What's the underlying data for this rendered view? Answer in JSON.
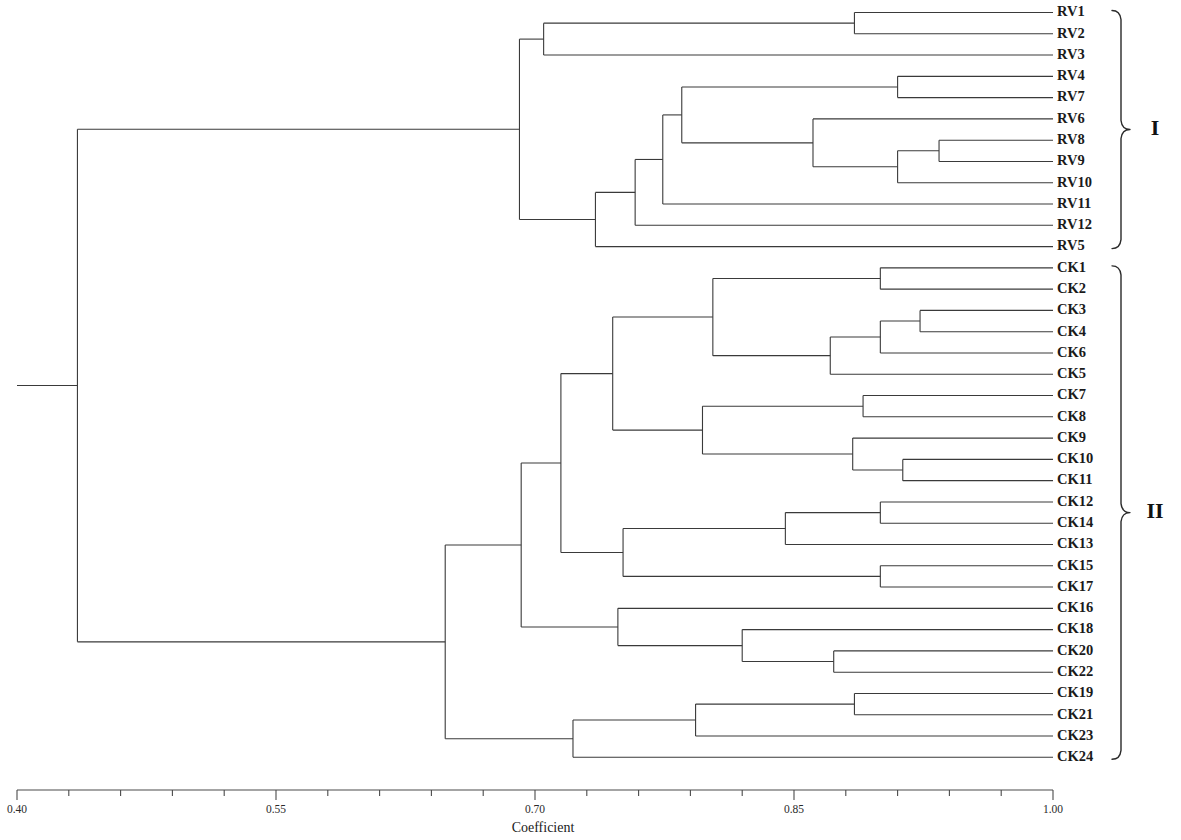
{
  "chart_data": {
    "type": "dendrogram",
    "title": "",
    "xlabel": "Coefficient",
    "ylabel": "",
    "xlim": [
      0.4,
      1.0
    ],
    "grid": false,
    "legend": "none",
    "axis": {
      "tick_labels": [
        "0.40",
        "0.55",
        "0.70",
        "0.85",
        "1.00"
      ],
      "tick_values": [
        0.4,
        0.55,
        0.7,
        0.85,
        1.0
      ],
      "minor_tick_step": 0.03,
      "minor_tick_values": [
        0.4,
        0.43,
        0.46,
        0.49,
        0.52,
        0.55,
        0.58,
        0.61,
        0.64,
        0.67,
        0.7,
        0.73,
        0.76,
        0.79,
        0.82,
        0.85,
        0.88,
        0.91,
        0.94,
        0.97,
        1.0
      ]
    },
    "leaves": [
      "RV1",
      "RV2",
      "RV3",
      "RV4",
      "RV7",
      "RV6",
      "RV8",
      "RV9",
      "RV10",
      "RV11",
      "RV12",
      "RV5",
      "CK1",
      "CK2",
      "CK3",
      "CK4",
      "CK6",
      "CK5",
      "CK7",
      "CK8",
      "CK9",
      "CK10",
      "CK11",
      "CK12",
      "CK14",
      "CK13",
      "CK15",
      "CK17",
      "CK16",
      "CK18",
      "CK20",
      "CK22",
      "CK19",
      "CK21",
      "CK23",
      "CK24"
    ],
    "leaf_tip_value": 1.0,
    "merges": [
      {
        "id": "n_rv1_rv2",
        "value": 0.885,
        "children": [
          "RV1",
          "RV2"
        ]
      },
      {
        "id": "n_rv123",
        "value": 0.705,
        "children": [
          "n_rv1_rv2",
          "RV3"
        ]
      },
      {
        "id": "n_rv4_rv7",
        "value": 0.91,
        "children": [
          "RV4",
          "RV7"
        ]
      },
      {
        "id": "n_rv8_rv9",
        "value": 0.934,
        "children": [
          "RV8",
          "RV9"
        ]
      },
      {
        "id": "n_rv89_10",
        "value": 0.91,
        "children": [
          "n_rv8_rv9",
          "RV10"
        ]
      },
      {
        "id": "n_rv6_grp",
        "value": 0.861,
        "children": [
          "RV6",
          "n_rv89_10"
        ]
      },
      {
        "id": "n_rv47_6grp",
        "value": 0.785,
        "children": [
          "n_rv4_rv7",
          "n_rv6_grp"
        ]
      },
      {
        "id": "n_rv_plus11",
        "value": 0.774,
        "children": [
          "n_rv47_6grp",
          "RV11"
        ]
      },
      {
        "id": "n_rv_plus12",
        "value": 0.758,
        "children": [
          "n_rv_plus11",
          "RV12"
        ]
      },
      {
        "id": "n_rv_plus5",
        "value": 0.735,
        "children": [
          "n_rv_plus12",
          "RV5"
        ]
      },
      {
        "id": "n_group_I",
        "value": 0.691,
        "children": [
          "n_rv123",
          "n_rv_plus5"
        ]
      },
      {
        "id": "n_ck1_ck2",
        "value": 0.9,
        "children": [
          "CK1",
          "CK2"
        ]
      },
      {
        "id": "n_ck3_ck4",
        "value": 0.923,
        "children": [
          "CK3",
          "CK4"
        ]
      },
      {
        "id": "n_ck34_6",
        "value": 0.9,
        "children": [
          "n_ck3_ck4",
          "CK6"
        ]
      },
      {
        "id": "n_ck346_5",
        "value": 0.871,
        "children": [
          "n_ck34_6",
          "CK5"
        ]
      },
      {
        "id": "n_ck12_346 5",
        "value": 0.803,
        "children": [
          "n_ck1_ck2",
          "n_ck346_5"
        ]
      },
      {
        "id": "n_ck7_ck8",
        "value": 0.89,
        "children": [
          "CK7",
          "CK8"
        ]
      },
      {
        "id": "n_ck10_ck11",
        "value": 0.913,
        "children": [
          "CK10",
          "CK11"
        ]
      },
      {
        "id": "n_ck9_1011",
        "value": 0.884,
        "children": [
          "CK9",
          "n_ck10_ck11"
        ]
      },
      {
        "id": "n_ck78_91011",
        "value": 0.797,
        "children": [
          "n_ck7_ck8",
          "n_ck9_1011"
        ]
      },
      {
        "id": "n_ck_upper",
        "value": 0.745,
        "children": [
          "n_ck12_346 5",
          "n_ck78_91011"
        ]
      },
      {
        "id": "n_ck12_ck14",
        "value": 0.9,
        "children": [
          "CK12",
          "CK14"
        ]
      },
      {
        "id": "n_ck1214_13",
        "value": 0.845,
        "children": [
          "n_ck12_ck14",
          "CK13"
        ]
      },
      {
        "id": "n_ck15_ck17",
        "value": 0.9,
        "children": [
          "CK15",
          "CK17"
        ]
      },
      {
        "id": "n_ck_mid",
        "value": 0.751,
        "children": [
          "n_ck1214_13",
          "n_ck15_ck17"
        ]
      },
      {
        "id": "n_ck_block_a",
        "value": 0.715,
        "children": [
          "n_ck_upper",
          "n_ck_mid"
        ]
      },
      {
        "id": "n_ck20_ck22",
        "value": 0.873,
        "children": [
          "CK20",
          "CK22"
        ]
      },
      {
        "id": "n_ck18_2022",
        "value": 0.82,
        "children": [
          "CK18",
          "n_ck20_ck22"
        ]
      },
      {
        "id": "n_ck16_block",
        "value": 0.748,
        "children": [
          "CK16",
          "n_ck18_2022"
        ]
      },
      {
        "id": "n_ck_block_b",
        "value": 0.692,
        "children": [
          "n_ck_block_a",
          "n_ck16_block"
        ]
      },
      {
        "id": "n_ck19_ck21",
        "value": 0.885,
        "children": [
          "CK19",
          "CK21"
        ]
      },
      {
        "id": "n_ck1921_23",
        "value": 0.793,
        "children": [
          "n_ck19_ck21",
          "CK23"
        ]
      },
      {
        "id": "n_ck_bottom",
        "value": 0.722,
        "children": [
          "n_ck1921_23",
          "CK24"
        ]
      },
      {
        "id": "n_group_II",
        "value": 0.648,
        "children": [
          "n_ck_block_b",
          "n_ck_bottom"
        ]
      },
      {
        "id": "n_root",
        "value": 0.435,
        "children": [
          "n_group_I",
          "n_group_II"
        ]
      }
    ],
    "groups": [
      {
        "label": "I",
        "first_leaf": "RV1",
        "last_leaf": "RV5"
      },
      {
        "label": "II",
        "first_leaf": "CK1",
        "last_leaf": "CK24"
      }
    ],
    "style": {
      "line_color": "#3a3a3a",
      "axis_color": "#4a4a4a",
      "background": "#ffffff"
    }
  }
}
